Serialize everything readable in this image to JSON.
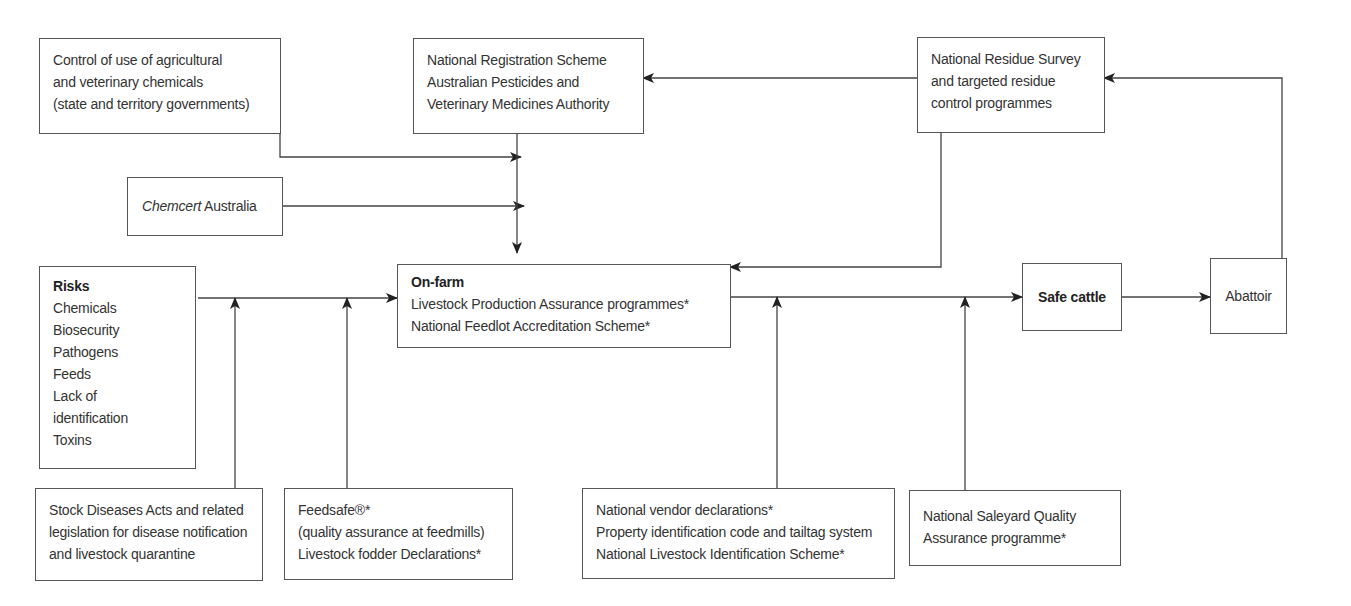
{
  "diagram": {
    "boxes": {
      "control_chemicals": {
        "lines": [
          "Control of use of agricultural",
          "and veterinary chemicals",
          "(state and territory governments)"
        ]
      },
      "national_registration": {
        "lines": [
          "National Registration Scheme",
          "Australian Pesticides and",
          "Veterinary Medicines Authority"
        ]
      },
      "residue_survey": {
        "lines": [
          "National Residue Survey",
          "and targeted residue",
          "control programmes"
        ]
      },
      "chemcert": {
        "italic": "Chemcert",
        "rest": " Australia"
      },
      "risks": {
        "title": "Risks",
        "items": [
          "Chemicals",
          "Biosecurity",
          "Pathogens",
          "Feeds",
          "Lack of",
          "identification",
          "Toxins"
        ]
      },
      "on_farm": {
        "title": "On-farm",
        "lines": [
          "Livestock Production Assurance programmes*",
          "National Feedlot Accreditation Scheme*"
        ]
      },
      "safe_cattle": {
        "label": "Safe cattle"
      },
      "abattoir": {
        "label": "Abattoir"
      },
      "stock_diseases": {
        "lines": [
          "Stock Diseases Acts and related",
          "legislation for disease notification",
          "and livestock quarantine"
        ]
      },
      "feedsafe": {
        "lines": [
          "Feedsafe®*",
          "(quality assurance at feedmills)",
          "Livestock fodder Declarations*"
        ]
      },
      "vendor_declarations": {
        "lines": [
          "National vendor declarations*",
          "Property identification code and tailtag system",
          "National Livestock Identification Scheme*"
        ]
      },
      "saleyard": {
        "lines": [
          "National Saleyard Quality",
          "Assurance programme*"
        ]
      }
    },
    "connectors": [
      {
        "from": "control_chemicals",
        "to": "on_farm_input_line"
      },
      {
        "from": "chemcert",
        "to": "on_farm_input_line"
      },
      {
        "from": "national_registration",
        "to": "on_farm"
      },
      {
        "from": "residue_survey",
        "to": "national_registration"
      },
      {
        "from": "residue_survey",
        "to": "on_farm"
      },
      {
        "from": "abattoir",
        "to": "residue_survey"
      },
      {
        "from": "risks",
        "to": "on_farm"
      },
      {
        "from": "stock_diseases",
        "to": "risks_line"
      },
      {
        "from": "feedsafe",
        "to": "risks_line"
      },
      {
        "from": "on_farm",
        "to": "safe_cattle"
      },
      {
        "from": "vendor_declarations",
        "to": "on_farm_output_line"
      },
      {
        "from": "saleyard",
        "to": "on_farm_output_line"
      },
      {
        "from": "safe_cattle",
        "to": "abattoir"
      }
    ],
    "colors": {
      "line": "#444444",
      "border": "#555555",
      "text": "#333333"
    }
  }
}
